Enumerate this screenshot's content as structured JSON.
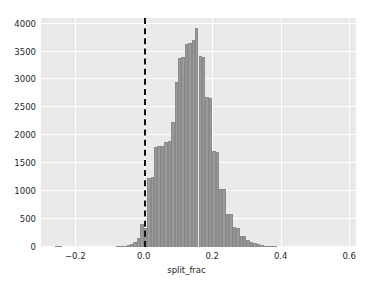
{
  "chart_data": {
    "type": "bar",
    "title": "",
    "subtitle": "",
    "xlabel": "split_frac",
    "ylabel": "",
    "xlim": [
      -0.3,
      0.62
    ],
    "ylim": [
      0,
      4100
    ],
    "grid": true,
    "legend": null,
    "bin_width": 0.01,
    "x_ticks": [
      "-0.2",
      "0.0",
      "0.2",
      "0.4",
      "0.6"
    ],
    "x_tick_values": [
      -0.2,
      0.0,
      0.2,
      0.4,
      0.6
    ],
    "y_ticks": [
      "0",
      "500",
      "1000",
      "1500",
      "2000",
      "2500",
      "3000",
      "3500",
      "4000"
    ],
    "y_tick_values": [
      0,
      500,
      1000,
      1500,
      2000,
      2500,
      3000,
      3500,
      4000
    ],
    "annotations": [
      {
        "name": "zero-reference-line",
        "type": "vline",
        "x": 0.0,
        "style": "dashed",
        "color": "#111111",
        "linewidth": 2
      }
    ],
    "bar_color": "#9a9a9a",
    "bar_edge_color": "#8a8a8a",
    "panel_color": "#eaeaea",
    "gridline_color": "#ffffff",
    "bins": [
      {
        "x": -0.255,
        "value": 6
      },
      {
        "x": -0.245,
        "value": 6
      },
      {
        "x": -0.075,
        "value": 8
      },
      {
        "x": -0.065,
        "value": 14
      },
      {
        "x": -0.055,
        "value": 22
      },
      {
        "x": -0.045,
        "value": 36
      },
      {
        "x": -0.035,
        "value": 58
      },
      {
        "x": -0.025,
        "value": 96
      },
      {
        "x": -0.015,
        "value": 160
      },
      {
        "x": -0.005,
        "value": 420
      },
      {
        "x": 0.005,
        "value": 340
      },
      {
        "x": 0.015,
        "value": 1240
      },
      {
        "x": 0.025,
        "value": 1255
      },
      {
        "x": 0.035,
        "value": 1790
      },
      {
        "x": 0.045,
        "value": 1800
      },
      {
        "x": 0.055,
        "value": 1810
      },
      {
        "x": 0.065,
        "value": 1880
      },
      {
        "x": 0.075,
        "value": 1890
      },
      {
        "x": 0.085,
        "value": 2230
      },
      {
        "x": 0.095,
        "value": 2960
      },
      {
        "x": 0.105,
        "value": 3390
      },
      {
        "x": 0.115,
        "value": 3400
      },
      {
        "x": 0.125,
        "value": 3630
      },
      {
        "x": 0.135,
        "value": 3660
      },
      {
        "x": 0.145,
        "value": 3700
      },
      {
        "x": 0.155,
        "value": 3930
      },
      {
        "x": 0.165,
        "value": 3420
      },
      {
        "x": 0.175,
        "value": 3410
      },
      {
        "x": 0.185,
        "value": 2680
      },
      {
        "x": 0.195,
        "value": 2670
      },
      {
        "x": 0.205,
        "value": 1720
      },
      {
        "x": 0.215,
        "value": 1710
      },
      {
        "x": 0.225,
        "value": 1040
      },
      {
        "x": 0.235,
        "value": 1030
      },
      {
        "x": 0.245,
        "value": 600
      },
      {
        "x": 0.255,
        "value": 590
      },
      {
        "x": 0.265,
        "value": 350
      },
      {
        "x": 0.275,
        "value": 345
      },
      {
        "x": 0.285,
        "value": 200
      },
      {
        "x": 0.295,
        "value": 190
      },
      {
        "x": 0.305,
        "value": 120
      },
      {
        "x": 0.315,
        "value": 95
      },
      {
        "x": 0.325,
        "value": 70
      },
      {
        "x": 0.335,
        "value": 50
      },
      {
        "x": 0.345,
        "value": 36
      },
      {
        "x": 0.355,
        "value": 26
      },
      {
        "x": 0.365,
        "value": 18
      },
      {
        "x": 0.375,
        "value": 12
      },
      {
        "x": 0.385,
        "value": 8
      }
    ]
  }
}
